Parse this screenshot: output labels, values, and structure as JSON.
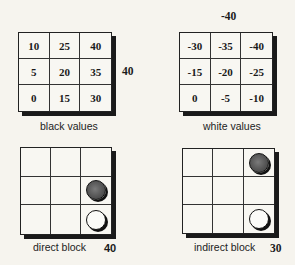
{
  "panels": {
    "black_values": {
      "caption": "black values",
      "side_value": "40",
      "cells": [
        [
          "10",
          "25",
          "40"
        ],
        [
          "5",
          "20",
          "35"
        ],
        [
          "0",
          "15",
          "30"
        ]
      ]
    },
    "white_values": {
      "caption": "white values",
      "top_value": "-40",
      "cells": [
        [
          "-30",
          "-35",
          "-40"
        ],
        [
          "-15",
          "-20",
          "-25"
        ],
        [
          "0",
          "-5",
          "-10"
        ]
      ]
    },
    "direct_block": {
      "caption": "direct block",
      "score": "40",
      "stones": [
        {
          "row": 1,
          "col": 2,
          "color": "black"
        },
        {
          "row": 2,
          "col": 2,
          "color": "white"
        }
      ]
    },
    "indirect_block": {
      "caption": "indirect block",
      "score": "30",
      "stones": [
        {
          "row": 0,
          "col": 2,
          "color": "black"
        },
        {
          "row": 2,
          "col": 2,
          "color": "white"
        }
      ]
    }
  },
  "colors": {
    "background": "#f6f4ee",
    "grid_line": "#222222",
    "black_stone": "#555555",
    "white_stone": "#fbfbf8"
  }
}
